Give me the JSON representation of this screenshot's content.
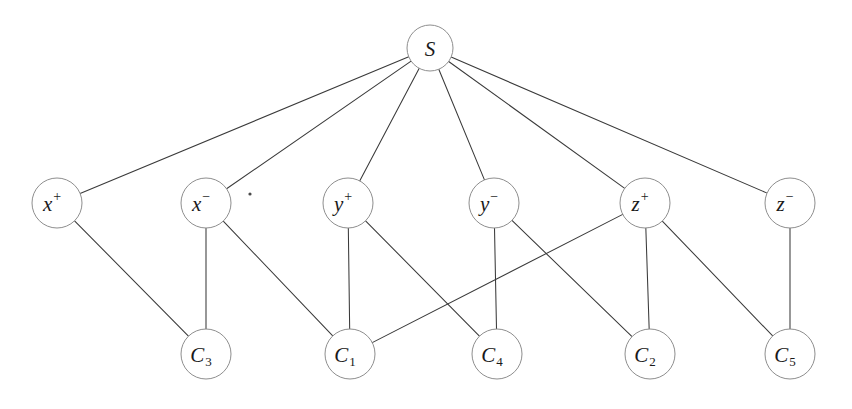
{
  "figure": {
    "background_color": "#ffffff",
    "edge_color": "#3a3a3a",
    "node_stroke_color": "#8e8e8e",
    "node_fill_color": "#ffffff",
    "label_color": "#1a1a1a",
    "width": 852,
    "height": 409
  },
  "nodes": {
    "source": {
      "id": "S",
      "label": "S",
      "base": "S",
      "sup": "",
      "sub": "",
      "cx": 430,
      "cy": 48,
      "r": 23
    },
    "literals": [
      {
        "id": "x+",
        "label": "x+",
        "base": "x",
        "sup": "+",
        "sub": "",
        "cx": 57,
        "cy": 203,
        "r": 25
      },
      {
        "id": "x-",
        "label": "x-",
        "base": "x",
        "sup": "−",
        "sub": "",
        "cx": 206,
        "cy": 203,
        "r": 25
      },
      {
        "id": "y+",
        "label": "y+",
        "base": "y",
        "sup": "+",
        "sub": "",
        "cx": 348,
        "cy": 203,
        "r": 25
      },
      {
        "id": "y-",
        "label": "y-",
        "base": "y",
        "sup": "−",
        "sub": "",
        "cx": 494,
        "cy": 203,
        "r": 25
      },
      {
        "id": "z+",
        "label": "z+",
        "base": "z",
        "sup": "+",
        "sub": "",
        "cx": 645,
        "cy": 203,
        "r": 25
      },
      {
        "id": "z-",
        "label": "z-",
        "base": "z",
        "sup": "−",
        "sub": "",
        "cx": 790,
        "cy": 203,
        "r": 25
      }
    ],
    "clauses": [
      {
        "id": "C3",
        "label": "C3",
        "base": "C",
        "sup": "",
        "sub": "3",
        "cx": 206,
        "cy": 354,
        "r": 25
      },
      {
        "id": "C1",
        "label": "C1",
        "base": "C",
        "sup": "",
        "sub": "1",
        "cx": 350,
        "cy": 354,
        "r": 25
      },
      {
        "id": "C4",
        "label": "C4",
        "base": "C",
        "sup": "",
        "sub": "4",
        "cx": 497,
        "cy": 354,
        "r": 25
      },
      {
        "id": "C2",
        "label": "C2",
        "base": "C",
        "sup": "",
        "sub": "2",
        "cx": 650,
        "cy": 354,
        "r": 25
      },
      {
        "id": "C5",
        "label": "C5",
        "base": "C",
        "sup": "",
        "sub": "5",
        "cx": 790,
        "cy": 354,
        "r": 25
      }
    ]
  },
  "edges": [
    {
      "from": "S",
      "to": "x+"
    },
    {
      "from": "S",
      "to": "x-"
    },
    {
      "from": "S",
      "to": "y+"
    },
    {
      "from": "S",
      "to": "y-"
    },
    {
      "from": "S",
      "to": "z+"
    },
    {
      "from": "S",
      "to": "z-"
    },
    {
      "from": "x+",
      "to": "C3"
    },
    {
      "from": "x-",
      "to": "C3"
    },
    {
      "from": "x-",
      "to": "C1"
    },
    {
      "from": "y+",
      "to": "C1"
    },
    {
      "from": "y+",
      "to": "C4"
    },
    {
      "from": "y-",
      "to": "C4"
    },
    {
      "from": "y-",
      "to": "C2"
    },
    {
      "from": "z+",
      "to": "C1"
    },
    {
      "from": "z+",
      "to": "C2"
    },
    {
      "from": "z+",
      "to": "C5"
    },
    {
      "from": "z-",
      "to": "C5"
    }
  ],
  "artifacts": [
    {
      "id": "speck-1",
      "cx": 250,
      "cy": 194,
      "r": 1.6
    }
  ]
}
